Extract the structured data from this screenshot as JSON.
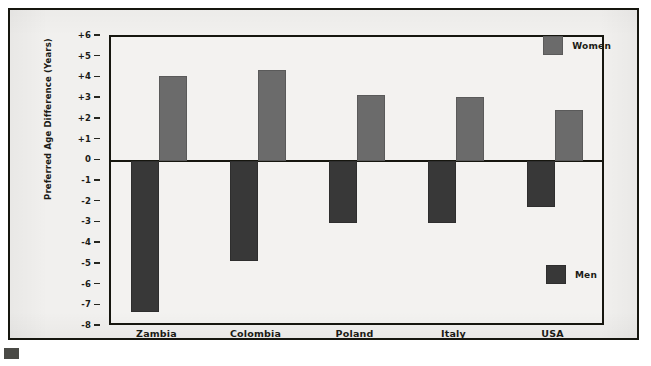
{
  "chart_data": {
    "type": "bar",
    "title": "",
    "subtitle": "",
    "xlabel": "",
    "ylabel": "Preferred Age Difference (Years)",
    "ylim": [
      -8,
      6
    ],
    "ytick_labels": [
      "+6",
      "+5",
      "+4",
      "+3",
      "+2",
      "+1",
      "0",
      "-1",
      "-2",
      "-3",
      "-4",
      "-5",
      "-6",
      "-7",
      "-8"
    ],
    "ytick_values": [
      6,
      5,
      4,
      3,
      2,
      1,
      0,
      -1,
      -2,
      -3,
      -4,
      -5,
      -6,
      -7,
      -8
    ],
    "grid": false,
    "legend_position": "inside-right",
    "categories": [
      "Zambia",
      "Colombia",
      "Poland",
      "Italy",
      "USA"
    ],
    "series": [
      {
        "name": "Men",
        "color": "#383838",
        "values": [
          -7.3,
          -4.8,
          -3.0,
          -3.0,
          -2.2
        ]
      },
      {
        "name": "Women",
        "color": "#6b6b6b",
        "values": [
          4.1,
          4.4,
          3.2,
          3.1,
          2.5
        ]
      }
    ],
    "annotations": []
  },
  "legend": {
    "women": {
      "label": "Women",
      "color": "#6b6b6b"
    },
    "men": {
      "label": "Men",
      "color": "#383838"
    }
  },
  "axis": {
    "y_title": "Preferred Age Difference (Years)"
  },
  "colors": {
    "frame": "#16160f",
    "background": "#f1f0ee",
    "plot_background": "#f3f2f0",
    "women_bar": "#6b6b6b",
    "men_bar": "#383838",
    "text": "#1b1b16"
  }
}
